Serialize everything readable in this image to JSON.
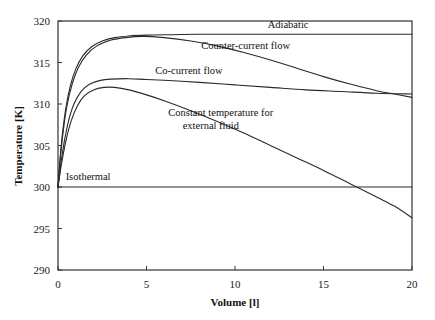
{
  "chart_data": {
    "type": "line",
    "title": "",
    "xlabel": "Volume [l]",
    "ylabel": "Temperature [K]",
    "xlim": [
      0,
      20
    ],
    "ylim": [
      290,
      320
    ],
    "xticks": [
      0,
      5,
      10,
      15,
      20
    ],
    "yticks": [
      290,
      295,
      300,
      305,
      310,
      315,
      320
    ],
    "grid": false,
    "legend_position": "inline-annotations",
    "series": [
      {
        "name": "Adiabatic",
        "label": "Adiabatic",
        "label_x": 13.0,
        "label_y": 319.2,
        "points": [
          [
            0.0,
            300.0
          ],
          [
            0.1,
            303.0
          ],
          [
            0.25,
            306.4
          ],
          [
            0.45,
            309.6
          ],
          [
            0.7,
            312.2
          ],
          [
            1.0,
            314.2
          ],
          [
            1.4,
            315.8
          ],
          [
            1.9,
            316.9
          ],
          [
            2.5,
            317.6
          ],
          [
            3.2,
            318.0
          ],
          [
            4.0,
            318.2
          ],
          [
            5.0,
            318.3
          ],
          [
            6.5,
            318.35
          ],
          [
            8.0,
            318.4
          ],
          [
            11.0,
            318.4
          ],
          [
            14.0,
            318.4
          ],
          [
            17.0,
            318.4
          ],
          [
            20.0,
            318.4
          ]
        ]
      },
      {
        "name": "Counter-current flow",
        "label": "Counter-current flow",
        "label_x": 10.6,
        "label_y": 316.6,
        "points": [
          [
            0.0,
            300.0
          ],
          [
            0.12,
            303.2
          ],
          [
            0.3,
            306.8
          ],
          [
            0.5,
            309.7
          ],
          [
            0.8,
            312.4
          ],
          [
            1.15,
            314.4
          ],
          [
            1.6,
            315.9
          ],
          [
            2.2,
            317.0
          ],
          [
            3.0,
            317.7
          ],
          [
            3.8,
            318.0
          ],
          [
            4.8,
            318.15
          ],
          [
            6.0,
            318.0
          ],
          [
            7.5,
            317.6
          ],
          [
            9.0,
            317.0
          ],
          [
            10.5,
            316.2
          ],
          [
            12.0,
            315.3
          ],
          [
            13.5,
            314.3
          ],
          [
            15.0,
            313.3
          ],
          [
            16.5,
            312.4
          ],
          [
            18.0,
            311.6
          ],
          [
            19.0,
            311.2
          ],
          [
            20.0,
            310.8
          ]
        ]
      },
      {
        "name": "Co-current flow",
        "label": "Co-current flow",
        "label_x": 7.4,
        "label_y": 313.6,
        "points": [
          [
            0.0,
            300.0
          ],
          [
            0.15,
            302.6
          ],
          [
            0.35,
            305.4
          ],
          [
            0.6,
            308.0
          ],
          [
            0.9,
            310.0
          ],
          [
            1.3,
            311.5
          ],
          [
            1.8,
            312.4
          ],
          [
            2.4,
            312.85
          ],
          [
            3.0,
            313.0
          ],
          [
            4.0,
            313.05
          ],
          [
            5.0,
            312.95
          ],
          [
            6.5,
            312.8
          ],
          [
            8.0,
            312.6
          ],
          [
            10.0,
            312.3
          ],
          [
            12.0,
            312.0
          ],
          [
            14.0,
            311.7
          ],
          [
            16.0,
            311.5
          ],
          [
            18.0,
            311.3
          ],
          [
            20.0,
            311.2
          ]
        ]
      },
      {
        "name": "Constant temperature for external fluid",
        "label_line1": "Constant temperature for",
        "label_line2": "external fluid",
        "label_x": 9.2,
        "label_y": 308.6,
        "points": [
          [
            0.0,
            300.0
          ],
          [
            0.2,
            302.8
          ],
          [
            0.45,
            305.6
          ],
          [
            0.75,
            308.0
          ],
          [
            1.1,
            309.8
          ],
          [
            1.5,
            311.0
          ],
          [
            2.0,
            311.7
          ],
          [
            2.6,
            312.0
          ],
          [
            3.2,
            312.0
          ],
          [
            4.0,
            311.7
          ],
          [
            5.0,
            311.1
          ],
          [
            6.0,
            310.4
          ],
          [
            7.5,
            309.2
          ],
          [
            9.0,
            307.9
          ],
          [
            10.5,
            306.5
          ],
          [
            12.0,
            305.0
          ],
          [
            13.5,
            303.5
          ],
          [
            15.0,
            302.0
          ],
          [
            16.5,
            300.4
          ],
          [
            18.0,
            298.8
          ],
          [
            19.0,
            297.7
          ],
          [
            20.0,
            296.3
          ]
        ]
      },
      {
        "name": "Isothermal",
        "label": "Isothermal",
        "label_x": 1.7,
        "label_y": 300.9,
        "points": [
          [
            0.0,
            300.0
          ],
          [
            5.0,
            300.0
          ],
          [
            10.0,
            300.0
          ],
          [
            15.0,
            300.0
          ],
          [
            20.0,
            300.0
          ]
        ]
      }
    ]
  }
}
